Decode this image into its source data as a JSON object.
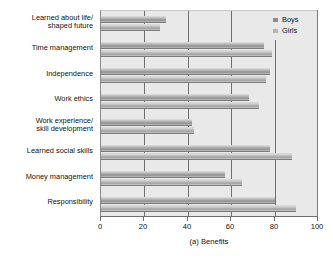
{
  "chart_data": {
    "type": "bar",
    "orientation": "horizontal",
    "title": "",
    "xlabel": "(a) Benefits",
    "ylabel": "",
    "xlim": [
      0,
      100
    ],
    "xticks": [
      0,
      20,
      40,
      60,
      80,
      100
    ],
    "grid": true,
    "legend_position": "top-right",
    "categories": [
      "Learned about life/\nshaped future",
      "Time management",
      "Independence",
      "Work ethics",
      "Work experience/\nskill development",
      "Learned social skills",
      "Money management",
      "Responsibility"
    ],
    "series": [
      {
        "name": "Boys",
        "color": "#8d8d8d",
        "values": [
          30,
          75,
          78,
          68,
          42,
          78,
          57,
          80
        ]
      },
      {
        "name": "Girls",
        "color": "#b6b6b6",
        "values": [
          27,
          79,
          76,
          73,
          43,
          88,
          65,
          90
        ]
      }
    ]
  },
  "figure": {
    "caption": "(a) Benefits",
    "plot_background": "#e9e9e9",
    "gridline_color": "#6f6f6f"
  }
}
